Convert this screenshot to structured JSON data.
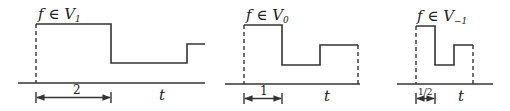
{
  "panels": [
    {
      "title": "f ∈ V",
      "subscript": "1",
      "interval_label": "2",
      "axis_label": "t"
    },
    {
      "title": "f ∈ V",
      "subscript": "0",
      "interval_label": "1",
      "axis_label": "t"
    },
    {
      "title": "f ∈ V",
      "subscript": "−1",
      "interval_label": "1/2",
      "axis_label": "t"
    }
  ],
  "colors": {
    "stroke": "#333333",
    "background": "#ffffff"
  }
}
